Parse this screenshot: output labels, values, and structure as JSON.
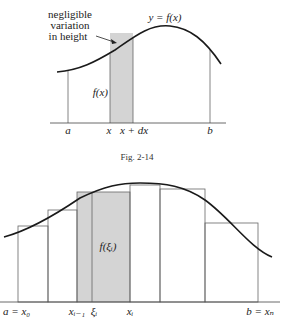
{
  "figure_top": {
    "annotation": [
      "negligible",
      "variation",
      "in height"
    ],
    "curve_label": "y = f(x)",
    "strip_label": "f(x)",
    "axis_labels": [
      "a",
      "x",
      "x + dx",
      "b"
    ],
    "caption": "Fig. 2-14"
  },
  "figure_bottom": {
    "rect_label": "f(ξᵢ)",
    "axis_labels": {
      "start": "a = x₀",
      "x_prev": "xᵢ₋₁",
      "xi_point": "ξᵢ",
      "x_i": "xᵢ",
      "end": "b = xₙ"
    }
  },
  "colors": {
    "shade": "#d4d4d4",
    "line": "#222222",
    "thin_line": "#666666"
  }
}
